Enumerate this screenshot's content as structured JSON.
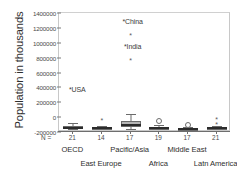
{
  "chart": {
    "type": "boxplot",
    "ylabel": "Population in thousands",
    "xlabel": "",
    "title": "",
    "n_prefix": "N =",
    "grid": false,
    "legend": "none"
  },
  "yaxis": {
    "ticks": [
      {
        "value": 1400000,
        "label": "1400000"
      },
      {
        "value": 1200000,
        "label": "1200000"
      },
      {
        "value": 1000000,
        "label": "1000000"
      },
      {
        "value": 800000,
        "label": "800000"
      },
      {
        "value": 600000,
        "label": "600000"
      },
      {
        "value": 400000,
        "label": "400000"
      },
      {
        "value": 200000,
        "label": "200000"
      },
      {
        "value": 0,
        "label": "0"
      },
      {
        "value": -200000,
        "label": "-200000"
      }
    ],
    "min": -200000,
    "max": 1400000
  },
  "chart_data": {
    "type": "boxplot",
    "title": "",
    "xlabel": "",
    "ylabel": "Population in thousands",
    "ylim": [
      -200000,
      1400000
    ],
    "grid": false,
    "legend": "none",
    "categories": [
      "OECD",
      "East Europe",
      "Pacific/Asia",
      "Africa",
      "Middle East",
      "Latn America"
    ],
    "n": [
      21,
      14,
      17,
      19,
      17,
      21
    ],
    "boxes": [
      {
        "category": "OECD",
        "n": 21,
        "whisker_low": 5000,
        "q1": 10000,
        "median": 20000,
        "q3": 40000,
        "whisker_high": 80000,
        "outliers": []
      },
      {
        "category": "East Europe",
        "n": 14,
        "whisker_low": 2000,
        "q1": 5000,
        "median": 10000,
        "q3": 25000,
        "whisker_high": 45000,
        "outliers": [
          145000
        ]
      },
      {
        "category": "Pacific/Asia",
        "n": 17,
        "whisker_low": 5000,
        "q1": 22000,
        "median": 55000,
        "q3": 110000,
        "whisker_high": 200000,
        "outliers": [
          1290000,
          960000
        ]
      },
      {
        "category": "Africa",
        "n": 19,
        "whisker_low": 2000,
        "q1": 6000,
        "median": 12000,
        "q3": 30000,
        "whisker_high": 55000,
        "outliers": [
          105000
        ]
      },
      {
        "category": "Middle East",
        "n": 17,
        "whisker_low": 1000,
        "q1": 4000,
        "median": 8000,
        "q3": 18000,
        "whisker_high": 30000,
        "outliers": [
          60000
        ]
      },
      {
        "category": "Latn America",
        "n": 21,
        "whisker_low": 1000,
        "q1": 5000,
        "median": 10000,
        "q3": 28000,
        "whisker_high": 45000,
        "outliers": [
          160000,
          95000
        ]
      }
    ],
    "annotations": [
      {
        "label": "*USA",
        "category": "OECD",
        "value": 270000
      },
      {
        "label": "*China",
        "category": "Pacific/Asia",
        "value": 1290000
      },
      {
        "label": "*India",
        "category": "Pacific/Asia",
        "value": 960000
      }
    ]
  },
  "labels": {
    "usa": "*USA",
    "china": "*China",
    "india": "*India",
    "oecd": "OECD",
    "east_europe": "East Europe",
    "pacific_asia": "Pacific/Asia",
    "africa": "Africa",
    "middle_east": "Middle East",
    "latin_america": "Latn America"
  },
  "colors": {
    "box_fill": "#b5b5b5",
    "box_stroke": "#6b6b6b",
    "median": "#2b2b2b",
    "axis": "#6e6e6e",
    "frame": "#c8c8c8",
    "text": "#2e2e2e",
    "background": "#ffffff"
  }
}
